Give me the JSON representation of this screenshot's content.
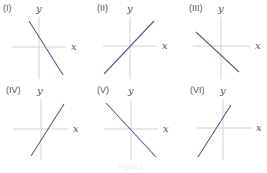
{
  "figure": {
    "caption": "Figure 1.",
    "axis_labels": {
      "x": "x",
      "y": "y"
    },
    "colors": {
      "line": "#5b5e8c",
      "axis": "#c8c8cc",
      "text": "#555555"
    },
    "panels": [
      {
        "label": "(I)",
        "slope_sign": "negative",
        "y_intercept": "positive",
        "x_intercept": "positive"
      },
      {
        "label": "(II)",
        "slope_sign": "positive",
        "y_intercept": "zero",
        "x_intercept": "zero"
      },
      {
        "label": "(III)",
        "slope_sign": "negative",
        "y_intercept": "negative",
        "x_intercept": "negative"
      },
      {
        "label": "(IV)",
        "slope_sign": "positive",
        "y_intercept": "negative",
        "x_intercept": "positive"
      },
      {
        "label": "(V)",
        "slope_sign": "negative",
        "y_intercept": "zero",
        "x_intercept": "zero"
      },
      {
        "label": "(VI)",
        "slope_sign": "positive",
        "y_intercept": "positive",
        "x_intercept": "negative"
      }
    ]
  }
}
